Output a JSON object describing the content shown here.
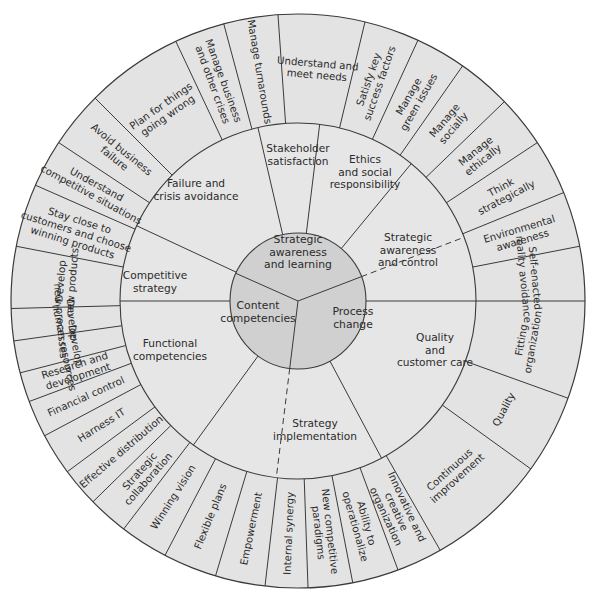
{
  "colors": {
    "background": "#ffffff",
    "outer_ring": "#e3e3e3",
    "middle_ring": "#e6e6e6",
    "core": "#d0d0d0",
    "line": "#3a3a3a",
    "text": "#2b2b2b"
  },
  "geometry": {
    "cx": 298,
    "cy": 301,
    "r_outer": 287,
    "r_middle": 178,
    "r_core": 68
  },
  "core": {
    "segments": [
      {
        "label": [
          "Strategic",
          "awareness",
          "and learning"
        ]
      },
      {
        "label": [
          "Process",
          "change"
        ]
      },
      {
        "label": [
          "Content",
          "competencies"
        ]
      }
    ],
    "spokes_deg": [
      294,
      69,
      187
    ]
  },
  "middle_ring": {
    "segments": [
      {
        "label": [
          "Failure and",
          "crisis avoidance"
        ]
      },
      {
        "label": [
          "Stakeholder",
          "satisfaction"
        ]
      },
      {
        "label": [
          "Ethics",
          "and social",
          "responsibility"
        ]
      },
      {
        "label": [
          "Strategic",
          "awareness",
          "and control"
        ]
      },
      {
        "label": [
          "Quality",
          "and",
          "customer care"
        ]
      },
      {
        "label": [
          "Strategy",
          "implementation"
        ]
      },
      {
        "label": [
          "Functional",
          "competencies"
        ]
      },
      {
        "label": [
          "Competitive",
          "strategy"
        ]
      }
    ],
    "spokes_deg": [
      295,
      347,
      7,
      39.5,
      90,
      152,
      216,
      270
    ],
    "dashed_spokes_deg": [
      69,
      187
    ]
  },
  "outer_ring": {
    "segments": [
      {
        "label": [
          "Understand and",
          "meet needs"
        ]
      },
      {
        "label": [
          "Satisfy key",
          "success factors"
        ]
      },
      {
        "label": [
          "Manage",
          "green issues"
        ]
      },
      {
        "label": [
          "Manage",
          "socially"
        ]
      },
      {
        "label": [
          "Manage",
          "ethically"
        ]
      },
      {
        "label": [
          "Think",
          "strategically"
        ]
      },
      {
        "label": [
          "Environmental",
          "awareness"
        ]
      },
      {
        "label": [
          "Self-enacted",
          "reality avoidance"
        ]
      },
      {
        "label": [
          "Fitting",
          "organization"
        ]
      },
      {
        "label": [
          "Quality"
        ]
      },
      {
        "label": [
          "Continuous",
          "improvement"
        ]
      },
      {
        "label": [
          "Innovative and",
          "creative",
          "organization"
        ]
      },
      {
        "label": [
          "Ability to",
          "operationalize"
        ]
      },
      {
        "label": [
          "New competitive",
          "paradigms"
        ]
      },
      {
        "label": [
          "Internal synergy"
        ]
      },
      {
        "label": [
          "Empowerment"
        ]
      },
      {
        "label": [
          "Flexible plans"
        ]
      },
      {
        "label": [
          "Winning vision"
        ]
      },
      {
        "label": [
          "Strategic",
          "collaboration"
        ]
      },
      {
        "label": [
          "Effective distribution"
        ]
      },
      {
        "label": [
          "Harness IT"
        ]
      },
      {
        "label": [
          "Financial control"
        ]
      },
      {
        "label": [
          "Research and",
          "development"
        ]
      },
      {
        "label": [
          "Develop",
          "human resources"
        ]
      },
      {
        "label": [
          "Develop",
          "new processes"
        ]
      },
      {
        "label": [
          "Develop",
          "new products"
        ]
      },
      {
        "label": [
          "Stay close to",
          "customers and choose",
          "winning products"
        ]
      },
      {
        "label": [
          "Understand",
          "competitive situations"
        ]
      },
      {
        "label": [
          "Avoid business",
          "failure"
        ]
      },
      {
        "label": [
          "Plan for things",
          "going wrong"
        ]
      },
      {
        "label": [
          "Manage business",
          "and other crises"
        ]
      },
      {
        "label": [
          "Manage turnarounds"
        ]
      }
    ],
    "spokes_deg": [
      356,
      13.5,
      24.7,
      35,
      46,
      56.5,
      67.8,
      79,
      90,
      109.8,
      125.8,
      150.3,
      159.6,
      169,
      178,
      186.6,
      196.7,
      207.6,
      217.4,
      225.6,
      233.5,
      242,
      249.5,
      255.5,
      262,
      268.5,
      281,
      293.8,
      303.5,
      315,
      334.8,
      345
    ]
  }
}
